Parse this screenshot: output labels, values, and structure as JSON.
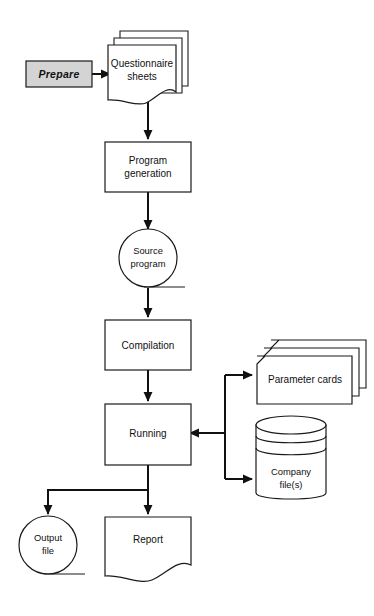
{
  "diagram": {
    "background_color": "#ffffff",
    "line_color": "#111111",
    "shape_fill": "#ffffff",
    "shaded_fill": "#d4d4d4",
    "nodes": [
      {
        "id": "prepare",
        "label": "Prepare",
        "shape": "process-shaded",
        "style": "bold-italic",
        "fill": "#d4d4d4"
      },
      {
        "id": "questionnaire-sheets",
        "label_line1": "Questionnaire",
        "label_line2": "sheets",
        "shape": "document-stack",
        "count": 3
      },
      {
        "id": "program-generation",
        "label_line1": "Program",
        "label_line2": "generation",
        "shape": "rectangle"
      },
      {
        "id": "source-program",
        "label_line1": "Source",
        "label_line2": "program",
        "shape": "magnetic-tape"
      },
      {
        "id": "compilation",
        "label": "Compilation",
        "shape": "rectangle"
      },
      {
        "id": "running",
        "label": "Running",
        "shape": "rectangle"
      },
      {
        "id": "parameter-cards",
        "label": "Parameter  cards",
        "shape": "punched-card-stack",
        "count": 3
      },
      {
        "id": "company-files",
        "label_line1": "Company",
        "label_line2": "file(s)",
        "shape": "disk-cylinder"
      },
      {
        "id": "output-file",
        "label_line1": "Output",
        "label_line2": "file",
        "shape": "magnetic-tape"
      },
      {
        "id": "report",
        "label": "Report",
        "shape": "document"
      }
    ],
    "edges": [
      {
        "from": "prepare",
        "to": "questionnaire-sheets",
        "direction": "right"
      },
      {
        "from": "questionnaire-sheets",
        "to": "program-generation",
        "direction": "down"
      },
      {
        "from": "program-generation",
        "to": "source-program",
        "direction": "down"
      },
      {
        "from": "source-program",
        "to": "compilation",
        "direction": "down"
      },
      {
        "from": "compilation",
        "to": "running",
        "direction": "down"
      },
      {
        "from": "parameter-cards",
        "to": "running",
        "direction": "left"
      },
      {
        "from": "company-files",
        "to": "running",
        "direction": "left"
      },
      {
        "from": "running",
        "to": "parameter-cards",
        "direction": "right"
      },
      {
        "from": "running",
        "to": "company-files",
        "direction": "right"
      },
      {
        "from": "running",
        "to": "output-file",
        "direction": "down-left"
      },
      {
        "from": "running",
        "to": "report",
        "direction": "down"
      }
    ]
  }
}
